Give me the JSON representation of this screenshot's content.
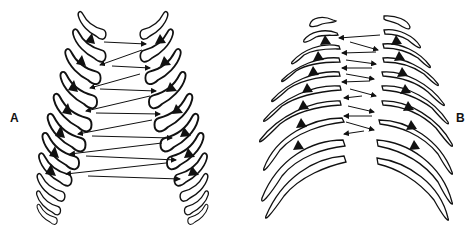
{
  "figure": {
    "panels": [
      {
        "id": "A",
        "label": "A",
        "description": "Narrow rib cage with steeply angled ribs; triangles mark rib attachment points; arrows alternate left-right between sides",
        "ribs_per_side": 11,
        "markers_per_side": 7,
        "arrow_count": 14
      },
      {
        "id": "B",
        "label": "B",
        "description": "Wide rib cage with flatter, longer ribs; triangles mark rib attachment points; short arrows alternate left-right between sides",
        "ribs_per_side": 9,
        "markers_per_side": 7,
        "arrow_count": 12
      }
    ],
    "colors": {
      "line": "#111111",
      "background": "#ffffff"
    }
  }
}
